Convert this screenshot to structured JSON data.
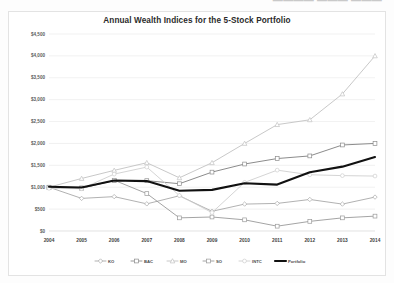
{
  "document": {
    "header_cut_text": "————  ———  ———"
  },
  "chart_data": {
    "type": "line",
    "title": "Annual Wealth Indices for the 5-Stock Portfolio",
    "xlabel": "",
    "ylabel": "",
    "grid": true,
    "legend_position": "bottom",
    "categories": [
      2004,
      2005,
      2006,
      2007,
      2008,
      2009,
      2010,
      2011,
      2012,
      2013,
      2014
    ],
    "x_tick_labels": [
      "2004",
      "2005",
      "2006",
      "2007",
      "2008",
      "2009",
      "2010",
      "2011",
      "2012",
      "2013",
      "2014"
    ],
    "ylim": [
      0,
      4500
    ],
    "y_ticks": [
      0,
      500,
      1000,
      1500,
      2000,
      2500,
      3000,
      3500,
      4000,
      4500
    ],
    "y_tick_labels": [
      "$0",
      "$500",
      "$1,000",
      "$1,500",
      "$2,000",
      "$2,500",
      "$3,000",
      "$3,500",
      "$4,000",
      "$4,500"
    ],
    "series": [
      {
        "name": "KO",
        "color": "#a8a8a8",
        "width": 0.9,
        "marker": "diamond",
        "values": [
          1000,
          745,
          785,
          620,
          805,
          450,
          615,
          630,
          720,
          615,
          775
        ]
      },
      {
        "name": "BAC",
        "color": "#8c8c8c",
        "width": 1.0,
        "marker": "square",
        "values": [
          1000,
          985,
          1150,
          1150,
          1080,
          1345,
          1530,
          1655,
          1715,
          1965,
          2000
        ]
      },
      {
        "name": "MO",
        "color": "#c2c2c2",
        "width": 0.9,
        "marker": "triangle",
        "values": [
          1000,
          1200,
          1385,
          1560,
          1215,
          1560,
          2000,
          2430,
          2540,
          3130,
          4000
        ]
      },
      {
        "name": "SO",
        "color": "#9a9a9a",
        "width": 0.9,
        "marker": "square",
        "values": [
          1000,
          975,
          1160,
          855,
          300,
          320,
          255,
          110,
          220,
          300,
          340
        ]
      },
      {
        "name": "INTC",
        "color": "#cfcfcf",
        "width": 0.9,
        "marker": "circle",
        "values": [
          975,
          965,
          1300,
          1460,
          810,
          420,
          1110,
          1390,
          1285,
          1265,
          1255
        ]
      },
      {
        "name": "Portfolio",
        "color": "#111111",
        "width": 2.1,
        "marker": "none",
        "values": [
          1010,
          995,
          1155,
          1140,
          920,
          940,
          1090,
          1060,
          1340,
          1470,
          1690
        ]
      }
    ]
  }
}
